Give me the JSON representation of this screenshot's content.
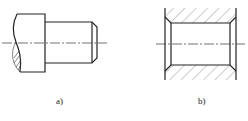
{
  "figures": [
    {
      "id": "a",
      "label": "a)",
      "description": "stepped shaft with broken-out head, chamfered end"
    },
    {
      "id": "b",
      "label": "b)",
      "description": "sectioned bushing/hole with chamfered bore edges"
    }
  ],
  "colors": {
    "line": "#222222",
    "background": "#ffffff"
  }
}
